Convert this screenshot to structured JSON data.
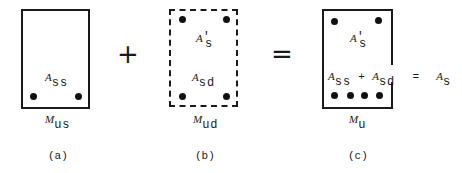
{
  "diagram": {
    "operators": {
      "plus": "+",
      "equals": "="
    },
    "section_a": {
      "caption": "(a)",
      "moment": {
        "main": "M",
        "sub": "us"
      },
      "steel_label": {
        "main": "A",
        "sub": "ss"
      },
      "border": "solid"
    },
    "section_b": {
      "caption": "(b)",
      "moment": {
        "main": "M",
        "sub": "ud"
      },
      "top_steel_label": {
        "main": "A",
        "prime": "′",
        "sub": "s"
      },
      "bottom_steel_label": {
        "main": "A",
        "sub": "sd"
      },
      "border": "dashed"
    },
    "section_c": {
      "caption": "(c)",
      "moment": {
        "main": "M",
        "sub": "u"
      },
      "top_steel_label": {
        "main": "A",
        "prime": "′",
        "sub": "s"
      },
      "sum_label": {
        "term1": {
          "main": "A",
          "sub": "ss"
        },
        "plus": "+",
        "term2": {
          "main": "A",
          "sub": "sd"
        },
        "equals": "=",
        "result": {
          "main": "A",
          "sub": "s"
        }
      },
      "border": "solid"
    }
  }
}
